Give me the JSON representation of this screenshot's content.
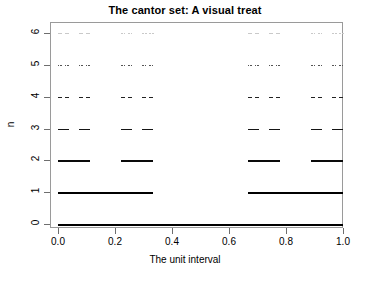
{
  "chart_data": {
    "type": "line",
    "title": "The cantor set: A visual treat",
    "xlabel": "The unit interval",
    "ylabel": "n",
    "xlim": [
      0,
      1
    ],
    "ylim": [
      0,
      6
    ],
    "grid": false,
    "legend": null,
    "x_ticks": [
      {
        "value": 0.0,
        "label": "0.0"
      },
      {
        "value": 0.2,
        "label": "0.2"
      },
      {
        "value": 0.4,
        "label": "0.4"
      },
      {
        "value": 0.6,
        "label": "0.6"
      },
      {
        "value": 0.8,
        "label": "0.8"
      },
      {
        "value": 1.0,
        "label": "1.0"
      }
    ],
    "y_ticks": [
      {
        "value": 0,
        "label": "0"
      },
      {
        "value": 1,
        "label": "1"
      },
      {
        "value": 2,
        "label": "2"
      },
      {
        "value": 3,
        "label": "3"
      },
      {
        "value": 4,
        "label": "4"
      },
      {
        "value": 5,
        "label": "5"
      },
      {
        "value": 6,
        "label": "6"
      }
    ],
    "series": [
      {
        "name": "n = 0",
        "n": 0,
        "y": 0,
        "segment_count": 1,
        "segment_length": 1,
        "line_width": 2.2,
        "color": "#000000",
        "segments": [
          [
            0,
            1
          ]
        ]
      },
      {
        "name": "n = 1",
        "n": 1,
        "y": 1,
        "segment_count": 2,
        "segment_length": 0.333333,
        "line_width": 2.1,
        "color": "#000000",
        "segments": [
          [
            0,
            0.333333
          ],
          [
            0.666667,
            1
          ]
        ]
      },
      {
        "name": "n = 2",
        "n": 2,
        "y": 2,
        "segment_count": 4,
        "segment_length": 0.111111,
        "line_width": 2.0,
        "color": "#0a0a0a",
        "segments": [
          [
            0,
            0.111111
          ],
          [
            0.222222,
            0.333333
          ],
          [
            0.666667,
            0.777778
          ],
          [
            0.888889,
            1
          ]
        ]
      },
      {
        "name": "n = 3",
        "n": 3,
        "y": 3,
        "segment_count": 8,
        "segment_length": 0.037037,
        "line_width": 1.9,
        "color": "#151515",
        "segments": [
          [
            0,
            0.037037
          ],
          [
            0.074074,
            0.111111
          ],
          [
            0.222222,
            0.259259
          ],
          [
            0.296296,
            0.333333
          ],
          [
            0.666667,
            0.703704
          ],
          [
            0.740741,
            0.777778
          ],
          [
            0.888889,
            0.925926
          ],
          [
            0.962963,
            1
          ]
        ]
      },
      {
        "name": "n = 4",
        "n": 4,
        "y": 4,
        "segment_count": 16,
        "segment_length": 0.012346,
        "line_width": 1.8,
        "color": "#222222",
        "segments": [
          [
            0,
            0.012346
          ],
          [
            0.024691,
            0.037037
          ],
          [
            0.074074,
            0.08642
          ],
          [
            0.098765,
            0.111111
          ],
          [
            0.222222,
            0.234568
          ],
          [
            0.246914,
            0.259259
          ],
          [
            0.296296,
            0.308642
          ],
          [
            0.320988,
            0.333333
          ],
          [
            0.666667,
            0.679012
          ],
          [
            0.691358,
            0.703704
          ],
          [
            0.740741,
            0.753086
          ],
          [
            0.765432,
            0.777778
          ],
          [
            0.888889,
            0.901235
          ],
          [
            0.91358,
            0.925926
          ],
          [
            0.962963,
            0.975309
          ],
          [
            0.987654,
            1
          ]
        ]
      },
      {
        "name": "n = 5",
        "n": 5,
        "y": 5,
        "segment_count": 32,
        "segment_length": 0.004115,
        "line_width": 1.6,
        "color": "#555555",
        "segments": []
      },
      {
        "name": "n = 6",
        "n": 6,
        "y": 6,
        "segment_count": 64,
        "segment_length": 0.001372,
        "line_width": 1.2,
        "color": "#c9c9c9",
        "segments": []
      }
    ]
  },
  "axes": {
    "box_color": "#9a9a9a",
    "tick_color": "#6e6e6e",
    "background": "#ffffff"
  }
}
